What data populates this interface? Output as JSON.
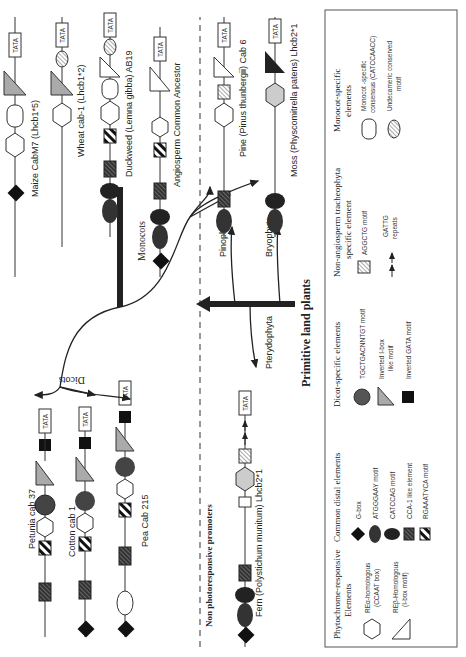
{
  "groups": {
    "dicots": "Dicots",
    "monocots": "Monocots",
    "angiosperm_ancestor": "Angiosperm Common Ancestor",
    "non_photoresponsive": "Non photoresponsive promoters",
    "primitive": "Primitive land plants",
    "pinophyta": "Pinophyta",
    "bryophyta": "Bryophyta",
    "pterydophyta": "Pterydophyta"
  },
  "promoters": {
    "petunia": "Petunia cab 37",
    "cotton": "Cotton cab 1",
    "pea": "Pea Cab 215",
    "maize": "Maize CabM7 (Lhcb1*5)",
    "wheat": "Wheat cab-1 (Lhcb1*2)",
    "duckweed": "Duckweed (Lemna gibba) AB19",
    "fern": "Fern (Polystichum munitum) Lhcb2*1",
    "pine": "Pine (Pinus thunbergii) Cab 6",
    "moss": "Moss (Physcomitrella patens) Lhcb2*1"
  },
  "tata": "TATA",
  "rea": "REα",
  "reb": "REβ",
  "legend": {
    "col1": {
      "title1": "Phytochrome-responsive",
      "title2": "Elements",
      "rea1": "REα-homologous",
      "rea2": "(CCAAT box)",
      "reb1": "REβ-Homologous",
      "reb2": "(I-box  motif)"
    },
    "col2": {
      "title": "Common distal elements",
      "items": [
        "G-box",
        "ATGGGAAY  motif",
        "CATCCAG  motif",
        "CCA-1  like  element",
        "RGAAATYCA  motif"
      ]
    },
    "col3": {
      "title": "Dicot-specific elements",
      "items": [
        "TGCTGACNNTGT  motif",
        "Inverted  I-box",
        "like  motif",
        "Inverted  GATA  motif"
      ]
    },
    "col4": {
      "title1": "Non-angiosperm tracheophyta",
      "title2": "specific element",
      "items": [
        "AGGCTG  motif",
        "GATTG",
        "repeats"
      ]
    },
    "col5": {
      "title1": "Monocot-specific",
      "title2": "elements",
      "items": [
        "Monocot -specific",
        "consensus  (CATCCAACC)",
        "Undecameric  conserved",
        "motif"
      ]
    }
  }
}
